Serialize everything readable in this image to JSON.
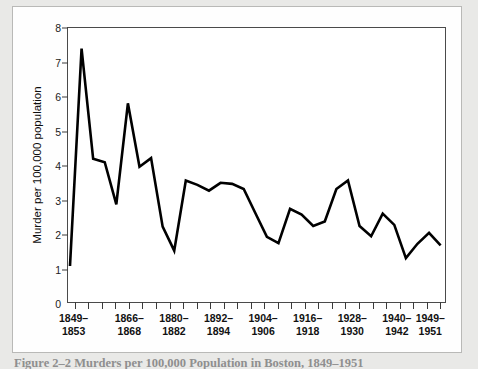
{
  "figure": {
    "caption": "Figure 2–2  Murders per 100,000 Population in Boston, 1849–1951"
  },
  "chart_data": {
    "type": "line",
    "title": "",
    "subtitle": "",
    "xlabel": "",
    "ylabel": "Murder per 100,000 population",
    "ylim": [
      0,
      8
    ],
    "ytick_labels": [
      "0",
      "1",
      "2",
      "3",
      "4",
      "5",
      "6",
      "7",
      "8"
    ],
    "ytick_values": [
      0,
      1,
      2,
      3,
      4,
      5,
      6,
      7,
      8
    ],
    "grid": false,
    "legend": "none",
    "line_color": "#000000",
    "line_width": 2.6,
    "n_points": 28,
    "xtick_count": 28,
    "xtick_labels": [
      {
        "index": 0,
        "line1": "1849–",
        "line2": "1853"
      },
      {
        "index": 5,
        "line1": "1866–",
        "line2": "1868"
      },
      {
        "index": 9,
        "line1": "1880–",
        "line2": "1882"
      },
      {
        "index": 13,
        "line1": "1892–",
        "line2": "1894"
      },
      {
        "index": 17,
        "line1": "1904–",
        "line2": "1906"
      },
      {
        "index": 21,
        "line1": "1916–",
        "line2": "1918"
      },
      {
        "index": 25,
        "line1": "1928–",
        "line2": "1930"
      },
      {
        "index": 29,
        "line1": "1940–",
        "line2": "1942"
      },
      {
        "index": 32,
        "line1": "1949–",
        "line2": "1951"
      }
    ],
    "categories": [
      "1849–1853",
      "1854–1856",
      "1857–1859",
      "1860–1862",
      "1863–1865",
      "1866–1868",
      "1869–1871",
      "1872–1874",
      "1875–1877",
      "1880–1882",
      "1883–1885",
      "1886–1888",
      "1889–1891",
      "1892–1894",
      "1895–1897",
      "1898–1900",
      "1901–1903",
      "1904–1906",
      "1907–1909",
      "1910–1912",
      "1913–1915",
      "1916–1918",
      "1919–1921",
      "1922–1924",
      "1925–1927",
      "1928–1930",
      "1931–1933",
      "1934–1936",
      "1937–1939",
      "1940–1942",
      "1943–1945",
      "1946–1948",
      "1949–1951"
    ],
    "values": [
      1.05,
      7.4,
      4.18,
      4.08,
      2.85,
      5.8,
      3.95,
      4.2,
      2.2,
      1.5,
      3.55,
      3.42,
      3.25,
      3.48,
      3.45,
      3.3,
      2.6,
      1.9,
      1.72,
      2.72,
      2.55,
      2.22,
      2.35,
      3.3,
      3.55,
      2.22,
      1.92,
      2.58,
      2.25,
      1.28,
      1.7,
      2.02,
      1.65
    ]
  }
}
